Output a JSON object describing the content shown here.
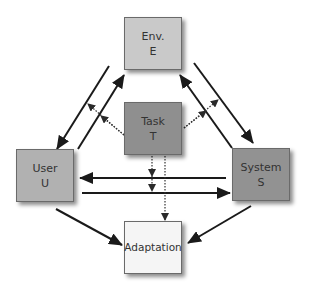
{
  "diagram": {
    "nodes": {
      "env": {
        "label": "Env.",
        "symbol": "E",
        "color": "#c9c9c9"
      },
      "task": {
        "label": "Task",
        "symbol": "T",
        "color": "#8f8f8f"
      },
      "user": {
        "label": "User",
        "symbol": "U",
        "color": "#b1b1b1"
      },
      "system": {
        "label": "System",
        "symbol": "S",
        "color": "#929292"
      },
      "adaptation": {
        "label": "Adaptation",
        "symbol": "",
        "color": "#f5f5f5"
      }
    },
    "edges": [
      {
        "from": "E",
        "to": "U",
        "style": "solid"
      },
      {
        "from": "U",
        "to": "E",
        "style": "solid"
      },
      {
        "from": "E",
        "to": "S",
        "style": "solid"
      },
      {
        "from": "S",
        "to": "E",
        "style": "solid"
      },
      {
        "from": "S",
        "to": "U",
        "style": "solid"
      },
      {
        "from": "U",
        "to": "S",
        "style": "solid"
      },
      {
        "from": "U",
        "to": "Adaptation",
        "style": "solid"
      },
      {
        "from": "S",
        "to": "Adaptation",
        "style": "solid"
      },
      {
        "from": "T",
        "to": "E-U links",
        "style": "dotted"
      },
      {
        "from": "T",
        "to": "E-S links",
        "style": "dotted"
      },
      {
        "from": "T",
        "to": "U-S links",
        "style": "dotted"
      },
      {
        "from": "T",
        "to": "Adaptation",
        "style": "dotted"
      }
    ]
  }
}
